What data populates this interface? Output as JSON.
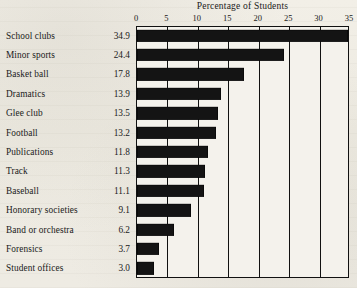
{
  "chart_data": {
    "type": "bar",
    "orientation": "horizontal",
    "title": "Percentage of Students",
    "xlabel": "",
    "ylabel": "",
    "xlim": [
      0,
      35
    ],
    "xticks": [
      0,
      5,
      10,
      15,
      20,
      25,
      30,
      35
    ],
    "xtick_labels": [
      "0",
      "5",
      "10",
      "15",
      "20",
      "25",
      "30",
      "35"
    ],
    "grid": true,
    "grid_axis": "x",
    "legend": false,
    "bar_color": "#141414",
    "background_color": "#efece4",
    "categories": [
      "School clubs",
      "Minor sports",
      "Basket ball",
      "Dramatics",
      "Glee club",
      "Football",
      "Publications",
      "Track",
      "Baseball",
      "Honorary societies",
      "Band or orchestra",
      "Forensics",
      "Student offices"
    ],
    "values": [
      34.9,
      24.4,
      17.8,
      13.9,
      13.5,
      13.2,
      11.8,
      11.3,
      11.1,
      9.1,
      6.2,
      3.7,
      3.0
    ],
    "value_labels": [
      "34.9",
      "24.4",
      "17.8",
      "13.9",
      "13.5",
      "13.2",
      "11.8",
      "11.3",
      "11.1",
      "9.1",
      "6.2",
      "3.7",
      "3.0"
    ]
  }
}
